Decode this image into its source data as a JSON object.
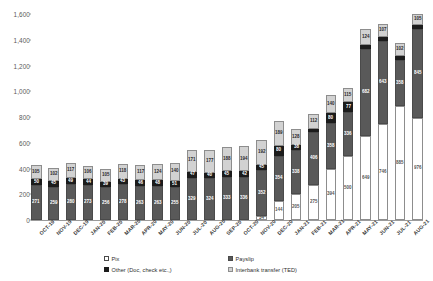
{
  "chart_data": {
    "type": "bar",
    "stacked": true,
    "title": "",
    "subtitle": "",
    "xlabel": "",
    "ylabel": "",
    "ylim": [
      0,
      1600
    ],
    "yticks": [
      0,
      200,
      400,
      600,
      800,
      1000,
      1200,
      1400,
      1600
    ],
    "ytick_labels": [
      "0",
      "200",
      "400",
      "600",
      "800",
      "1,000",
      "1,200",
      "1,400",
      "1,600"
    ],
    "grid": false,
    "legend_position": "bottom",
    "categories": [
      "OCT-19",
      "NOV-19",
      "DEC-19",
      "JAN-20",
      "FEB-20",
      "MAR-20",
      "APR-20",
      "MAY-20",
      "JUN-20",
      "JUL-20",
      "AUG-20",
      "SEP-20",
      "OCT-20",
      "NOV-20",
      "DEC-20",
      "JAN-21",
      "FEB-21",
      "MAR-21",
      "APR-21",
      "MAY-21",
      "JUN-21",
      "JUL-21",
      "AUG-21"
    ],
    "series": [
      {
        "name": "Pix",
        "color": "#ffffff",
        "values": [
          0,
          0,
          0,
          0,
          0,
          0,
          0,
          0,
          0,
          0,
          0,
          0,
          0,
          34,
          144,
          205,
          275,
          394,
          500,
          649,
          746,
          885,
          976
        ]
      },
      {
        "name": "Payslip",
        "color": "#595959",
        "values": [
          271,
          259,
          280,
          273,
          256,
          278,
          263,
          263,
          255,
          329,
          324,
          333,
          336,
          352,
          354,
          338,
          406,
          358,
          336,
          682,
          643,
          358,
          845
        ]
      },
      {
        "name": "Other (Doc, check etc.,)",
        "color": "#1c1c1c",
        "values": [
          50,
          45,
          49,
          44,
          39,
          43,
          46,
          48,
          51,
          47,
          40,
          45,
          42,
          45,
          80,
          38,
          27,
          80,
          77,
          29,
          30,
          30,
          29
        ]
      },
      {
        "name": "Interbank transfer (TED)",
        "color": "#d2d2d2",
        "values": [
          105,
          102,
          117,
          106,
          105,
          118,
          117,
          124,
          140,
          171,
          177,
          188,
          194,
          192,
          189,
          128,
          112,
          140,
          115,
          124,
          107,
          102,
          105
        ]
      }
    ],
    "totals": [
      426,
      406,
      446,
      423,
      400,
      439,
      426,
      435,
      446,
      547,
      541,
      566,
      572,
      623,
      767,
      709,
      793,
      972,
      1028,
      1484,
      1526,
      1375,
      1955
    ]
  },
  "legend": {
    "items": [
      {
        "label": "Pix",
        "swatch": "pix-swatch"
      },
      {
        "label": "Payslip",
        "swatch": "payslip-swatch"
      },
      {
        "label": "Other (Doc, check etc.,)",
        "swatch": "other-swatch"
      },
      {
        "label": "Interbank transfer (TED)",
        "swatch": "ted-swatch"
      }
    ]
  }
}
